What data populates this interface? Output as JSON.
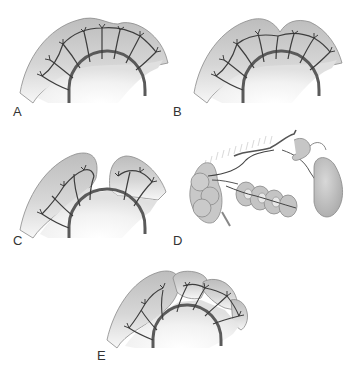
{
  "figure": {
    "panels": [
      {
        "id": "A",
        "label": "A",
        "description": "Intact mesenteric vascular arcades along bowel wall"
      },
      {
        "id": "B",
        "label": "B",
        "description": "Bowel with shallow notch; arcades intact"
      },
      {
        "id": "C",
        "label": "C",
        "description": "Bowel divided with gap; vessels separated"
      },
      {
        "id": "D",
        "label": "D",
        "description": "Vascular pedicle with coiled bowel segments and cecum/stomach-like pouch"
      },
      {
        "id": "E",
        "label": "E",
        "description": "Bowel divided into multiple lobed segments with arcades"
      }
    ]
  },
  "colors": {
    "bowel_fill": "#c4c4c4",
    "bowel_fill_light": "#ebebeb",
    "bowel_outline": "#7a7a7a",
    "vessel": "#5a5a5a",
    "vessel_dark": "#333333",
    "label_text": "#333333",
    "background": "#ffffff"
  }
}
